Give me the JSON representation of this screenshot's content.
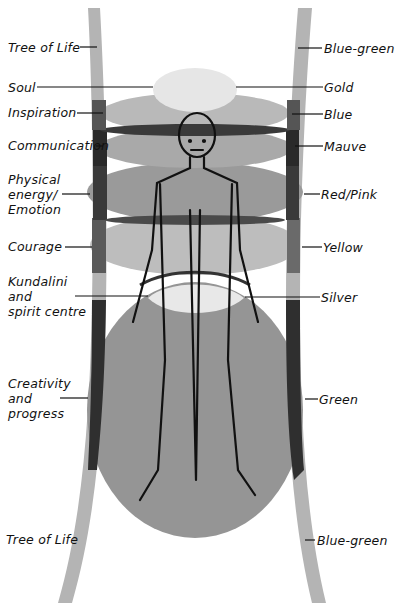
{
  "diagram": {
    "left_labels": [
      {
        "id": "tree-of-life-top",
        "text": "Tree of Life"
      },
      {
        "id": "soul",
        "text": "Soul"
      },
      {
        "id": "inspiration",
        "text": "Inspiration"
      },
      {
        "id": "communication",
        "text": "Communication"
      },
      {
        "id": "physical-energy",
        "lines": [
          "Physical",
          "energy/",
          "Emotion"
        ]
      },
      {
        "id": "courage",
        "text": "Courage"
      },
      {
        "id": "kundalini",
        "lines": [
          "Kundalini",
          "and",
          "spirit centre"
        ]
      },
      {
        "id": "creativity",
        "lines": [
          "Creativity",
          "and",
          "progress"
        ]
      },
      {
        "id": "tree-of-life-bottom",
        "text": "Tree of Life"
      }
    ],
    "right_labels": [
      {
        "id": "blue-green-top",
        "text": "Blue-green"
      },
      {
        "id": "gold",
        "text": "Gold"
      },
      {
        "id": "blue",
        "text": "Blue"
      },
      {
        "id": "mauve",
        "text": "Mauve"
      },
      {
        "id": "red-pink",
        "text": "Red/Pink"
      },
      {
        "id": "yellow",
        "text": "Yellow"
      },
      {
        "id": "silver",
        "text": "Silver"
      },
      {
        "id": "green",
        "text": "Green"
      },
      {
        "id": "blue-green-bottom",
        "text": "Blue-green"
      }
    ],
    "colors": {
      "background": "#ffffff",
      "tree_band": "#b4b4b4",
      "tree_band_overlap": "#2e2e2e",
      "gold": "#e6e6e6",
      "blue": "#b9b9b9",
      "mauve": "#a9a9a9",
      "red_pink": "#9a9a9a",
      "yellow": "#bdbdbd",
      "silver": "#e8e8e8",
      "green": "#959595",
      "band_dark": "#3a3a3a",
      "ink": "#111111"
    }
  }
}
